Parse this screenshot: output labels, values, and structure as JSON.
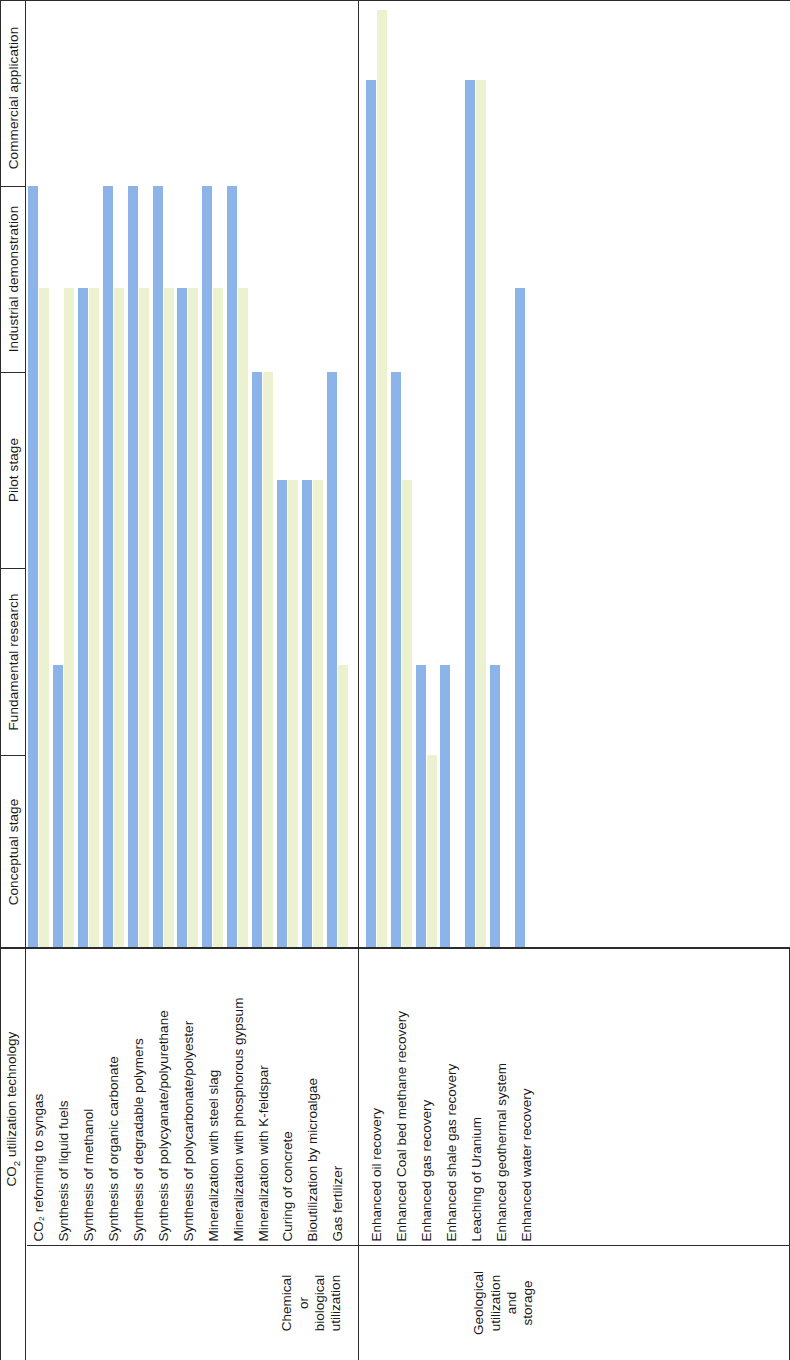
{
  "header": {
    "row_header": "CO2 utilization technology",
    "row_header_html": "CO₂ utilization technology"
  },
  "stages": [
    {
      "label": "Conceptual stage"
    },
    {
      "label": "Fundamental research"
    },
    {
      "label": "Pilot stage"
    },
    {
      "label": "Industrial demonstration"
    },
    {
      "label": "Commercial application"
    }
  ],
  "categories": [
    {
      "label": "Chemical or biological utilization",
      "lines": [
        "Chemical",
        "or",
        "biological",
        "utilization"
      ]
    },
    {
      "label": "Geological utilization and storage",
      "lines": [
        "Geological",
        "utilization",
        "and",
        "storage"
      ]
    }
  ],
  "legend": {
    "series_a": "China",
    "series_b": "World",
    "color_a": "#8cb4e8",
    "color_b": "#ecf2cf"
  },
  "chart_data": {
    "type": "bar",
    "title": "",
    "xlabel": "CO₂ utilization technology",
    "ylabel": "Development stage",
    "orientation": "vertical-bars-rotated-90",
    "stage_axis": [
      "Conceptual stage",
      "Fundamental research",
      "Pilot stage",
      "Industrial demonstration",
      "Commercial application"
    ],
    "stage_axis_bounds_px": [
      948,
      755,
      568,
      372,
      186,
      10
    ],
    "value_scale": "stage index 0..5 (bar top measured against stage bands)",
    "series": [
      {
        "name": "series-a",
        "color": "#8cb4e8"
      },
      {
        "name": "series-b",
        "color": "#ecf2cf"
      }
    ],
    "categories": [
      {
        "name": "Chemical or biological utilization",
        "rows": [
          {
            "label": "CO₂ reforming to syngas",
            "a": 4.0,
            "b": 3.45
          },
          {
            "label": "Synthesis of liquid fuels",
            "a": 1.48,
            "b": 3.45
          },
          {
            "label": "Synthesis of methanol",
            "a": 3.45,
            "b": 3.45
          },
          {
            "label": "Synthesis of organic carbonate",
            "a": 4.0,
            "b": 3.45
          },
          {
            "label": "Synthesis of degradable polymers",
            "a": 4.0,
            "b": 3.45
          },
          {
            "label": "Synthesis of polycyanate/polyurethane",
            "a": 4.0,
            "b": 3.45
          },
          {
            "label": "Synthesis of polycarbonate/polyester",
            "a": 3.45,
            "b": 3.45
          },
          {
            "label": "Mineralization with steel slag",
            "a": 4.0,
            "b": 3.45
          },
          {
            "label": "Mineralization with phosphorous gypsum",
            "a": 4.0,
            "b": 3.45
          },
          {
            "label": "Mineralization with K-feldspar",
            "a": 3.0,
            "b": 3.0
          },
          {
            "label": "Curing of concrete",
            "a": 2.45,
            "b": 2.45
          },
          {
            "label": "Bioutilization by microalgae",
            "a": 2.45,
            "b": 2.45
          },
          {
            "label": "Gas fertilizer",
            "a": 3.0,
            "b": 1.48
          }
        ]
      },
      {
        "name": "Geological utilization and storage",
        "rows": [
          {
            "label": "Enhanced oil recovery",
            "a": 4.6,
            "b": 5.0
          },
          {
            "label": "Enhanced Coal bed methane recovery",
            "a": 3.0,
            "b": 2.45
          },
          {
            "label": "Enhanced gas recovery",
            "a": 1.48,
            "b": 1.0
          },
          {
            "label": "Enhanced shale gas recovery",
            "a": 1.48,
            "b": 0.0
          },
          {
            "label": "Leaching of Uranium",
            "a": 4.6,
            "b": 4.6
          },
          {
            "label": "Enhanced geothermal system",
            "a": 1.48,
            "b": 0.0
          },
          {
            "label": "Enhanced water recovery",
            "a": 3.45,
            "b": 0.0
          }
        ]
      }
    ]
  }
}
